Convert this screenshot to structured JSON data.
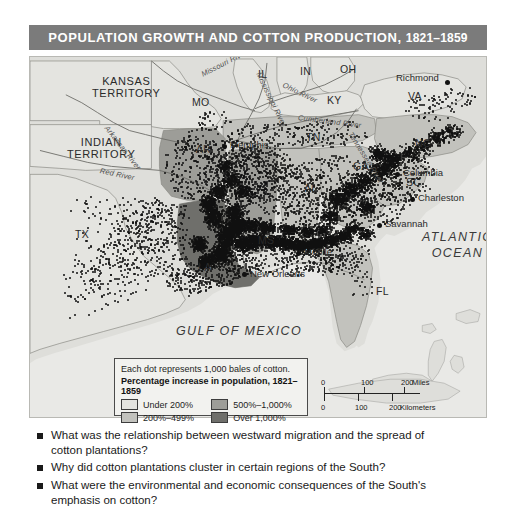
{
  "title": {
    "main": "POPULATION GROWTH AND COTTON PRODUCTION,",
    "years": "1821–1859"
  },
  "map": {
    "territories": [
      {
        "name": "kansas-territory",
        "line1": "KANSAS",
        "line2": "TERRITORY",
        "x": 62,
        "y": 19
      },
      {
        "name": "indian-territory",
        "line1": "INDIAN",
        "line2": "TERRITORY",
        "x": 37,
        "y": 80
      }
    ],
    "states": [
      {
        "name": "missouri",
        "label": "MO",
        "x": 162,
        "y": 40
      },
      {
        "name": "illinois",
        "label": "IL",
        "x": 228,
        "y": 12
      },
      {
        "name": "indiana",
        "label": "IN",
        "x": 270,
        "y": 9
      },
      {
        "name": "ohio",
        "label": "OH",
        "x": 310,
        "y": 7
      },
      {
        "name": "kentucky",
        "label": "KY",
        "x": 297,
        "y": 38
      },
      {
        "name": "virginia",
        "label": "VA",
        "x": 378,
        "y": 34
      },
      {
        "name": "north-carolina",
        "label": "NC",
        "x": 385,
        "y": 81
      },
      {
        "name": "tennessee",
        "label": "TN",
        "x": 276,
        "y": 75
      },
      {
        "name": "arkansas",
        "label": "AR",
        "x": 166,
        "y": 87
      },
      {
        "name": "georgia",
        "label": "GA",
        "x": 323,
        "y": 104
      },
      {
        "name": "alabama",
        "label": "AL",
        "x": 274,
        "y": 126
      },
      {
        "name": "mississippi",
        "label": "MS",
        "x": 228,
        "y": 178
      },
      {
        "name": "louisiana",
        "label": "LA",
        "x": 168,
        "y": 205
      },
      {
        "name": "texas",
        "label": "TX",
        "x": 45,
        "y": 172
      },
      {
        "name": "south-carolina",
        "label": "SC",
        "x": 376,
        "y": 120
      },
      {
        "name": "florida",
        "label": "FL",
        "x": 346,
        "y": 229
      }
    ],
    "cities": [
      {
        "name": "richmond",
        "label": "Richmond",
        "dotX": 417,
        "dotY": 25,
        "tx": 366,
        "ty": 16,
        "anchor": "right"
      },
      {
        "name": "memphis",
        "label": "Memphis",
        "dotX": 194,
        "dotY": 89,
        "tx": 200,
        "ty": 83,
        "anchor": "left"
      },
      {
        "name": "columbia",
        "label": "Columbia",
        "dotX": 367,
        "dotY": 117,
        "tx": 373,
        "ty": 111,
        "anchor": "left"
      },
      {
        "name": "charleston",
        "label": "Charleston",
        "dotX": 382,
        "dotY": 142,
        "tx": 388,
        "ty": 136,
        "anchor": "left"
      },
      {
        "name": "savannah",
        "label": "Savannah",
        "dotX": 349,
        "dotY": 168,
        "tx": 355,
        "ty": 162,
        "anchor": "left"
      },
      {
        "name": "mobile",
        "label": "Mobile",
        "dotX": 268,
        "dotY": 196,
        "tx": 274,
        "ty": 190,
        "anchor": "left"
      },
      {
        "name": "new-orleans",
        "label": "New Orleans",
        "dotX": 214,
        "dotY": 217,
        "tx": 220,
        "ty": 212,
        "anchor": "left"
      }
    ],
    "water_labels": [
      {
        "name": "atlantic-ocean",
        "line1": "ATLANTIC",
        "line2": "OCEAN",
        "x": 392,
        "y": 174
      },
      {
        "name": "gulf-of-mexico",
        "line1": "GULF OF MEXICO",
        "x": 146,
        "y": 268
      }
    ],
    "rivers": [
      {
        "name": "missouri-river",
        "label": "Missouri River",
        "x": 172,
        "y": 14,
        "rot": -27
      },
      {
        "name": "mississippi-river",
        "label": "Mississippi River",
        "x": 228,
        "y": 12,
        "rot": 64
      },
      {
        "name": "arkansas-river",
        "label": "Arkansas River",
        "x": 76,
        "y": 66,
        "rot": 52
      },
      {
        "name": "red-river",
        "label": "Red River",
        "x": 70,
        "y": 110,
        "rot": 12
      },
      {
        "name": "ohio-river",
        "label": "Ohio River",
        "x": 253,
        "y": 24,
        "rot": 26
      },
      {
        "name": "cumberland-river",
        "label": "Cumberland River",
        "x": 268,
        "y": 57,
        "rot": 7
      },
      {
        "name": "tennessee-river",
        "label": "Tennessee River",
        "x": 320,
        "y": 72,
        "rot": 58
      }
    ]
  },
  "legend": {
    "note": "Each dot represents 1,000 bales of cotton.",
    "heading": "Percentage increase in population, 1821–1859",
    "items": [
      {
        "label": "Under 200%",
        "color": "#e4e4e0"
      },
      {
        "label": "500%–1,000%",
        "color": "#9d9d98"
      },
      {
        "label": "200%–499%",
        "color": "#c2c2bd"
      },
      {
        "label": "Over 1,000%",
        "color": "#6f6f6b"
      }
    ]
  },
  "scale": {
    "miles": {
      "ticks": [
        "0",
        "100",
        "200"
      ],
      "unit": "Miles"
    },
    "kilometers": {
      "ticks": [
        "0",
        "100",
        "200"
      ],
      "unit": "Kilometers"
    }
  },
  "questions": [
    "What was the relationship between westward migration and the spread of cotton plantations?",
    "Why did cotton plantations cluster in certain regions of the South?",
    "What were the environmental and economic consequences of the South's emphasis on cotton?"
  ]
}
